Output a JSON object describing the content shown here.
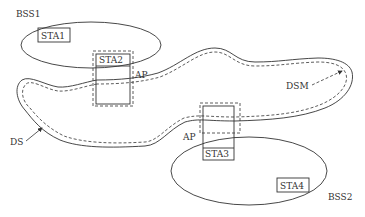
{
  "diagram": {
    "labels": {
      "bss1": "BSS1",
      "bss2": "BSS2",
      "sta1": "STA1",
      "sta2": "STA2",
      "sta3": "STA3",
      "sta4": "STA4",
      "ap_top": "AP",
      "ap_bottom": "AP",
      "ds": "DS",
      "dsm": "DSM"
    },
    "colors": {
      "stroke": "#333333",
      "background": "#ffffff"
    }
  }
}
